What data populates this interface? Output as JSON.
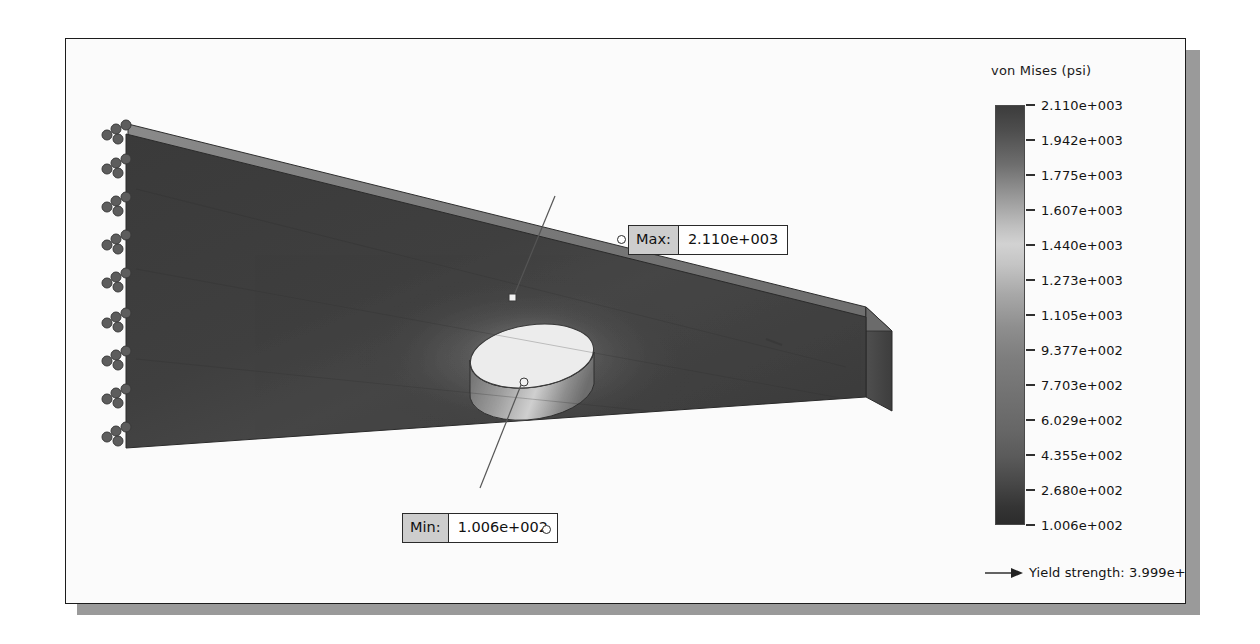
{
  "window": {
    "background_color": "#ffffff",
    "frame_border_color": "#1c1c1c",
    "frame_fill_color": "#fbfbfb",
    "shadow_color": "#9a9a9a"
  },
  "model": {
    "name": "plate-with-hole-fea-model",
    "description": "Rectangular flat plate with central circular hole, shaded von Mises stress plot",
    "face_color": "#3b3b3b",
    "edge_face_color": "#7d7d7d",
    "side_face_color": "#4e4e4e",
    "hole_top_color": "#efefef",
    "hole_wall_color": "#8d8d8d",
    "fixture_symbol_color": "#5f5f5f",
    "fixture_count": 9
  },
  "callouts": {
    "max": {
      "tag": "Max:",
      "value": "2.110e+003"
    },
    "min": {
      "tag": "Min:",
      "value": "1.006e+002"
    }
  },
  "legend": {
    "title": "von Mises (psi)",
    "units": "psi",
    "labels": [
      "2.110e+003",
      "1.942e+003",
      "1.775e+003",
      "1.607e+003",
      "1.440e+003",
      "1.273e+003",
      "1.105e+003",
      "9.377e+002",
      "7.703e+002",
      "6.029e+002",
      "4.355e+002",
      "2.680e+002",
      "1.006e+002"
    ],
    "yield": {
      "label": "Yield strength: 3.999e+003",
      "marker": "right-arrow-icon"
    }
  },
  "chart_data": {
    "type": "heatmap",
    "title": "von Mises (psi)",
    "colormap": "rainbow-grayscale",
    "colorbar_orientation": "vertical",
    "legend_position": "right",
    "units": "psi",
    "vmin": 100.6,
    "vmax": 2110.0,
    "tick_values": [
      2110.0,
      1942.0,
      1775.0,
      1607.0,
      1440.0,
      1273.0,
      1105.0,
      937.7,
      770.3,
      602.9,
      435.5,
      268.0,
      100.6
    ],
    "tick_labels": [
      "2.110e+003",
      "1.942e+003",
      "1.775e+003",
      "1.607e+003",
      "1.440e+003",
      "1.273e+003",
      "1.105e+003",
      "9.377e+002",
      "7.703e+002",
      "6.029e+002",
      "4.355e+002",
      "2.680e+002",
      "1.006e+002"
    ],
    "annotations": [
      {
        "name": "Max",
        "value": 2110.0,
        "label": "2.110e+003"
      },
      {
        "name": "Min",
        "value": 100.6,
        "label": "1.006e+002"
      }
    ],
    "reference_lines": [
      {
        "name": "Yield strength",
        "value": 3999.0,
        "label": "Yield strength: 3.999e+003"
      }
    ],
    "grid": false
  }
}
